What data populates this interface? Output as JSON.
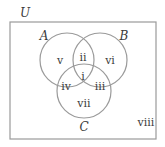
{
  "diagram": {
    "type": "venn",
    "universe": {
      "label": "U",
      "x": 20,
      "y": 17,
      "rect": {
        "x": 10,
        "y": 22,
        "w": 146,
        "h": 117
      }
    },
    "colors": {
      "stroke": "#9a9a9a",
      "text": "#3a3a3a",
      "background": "#ffffff"
    },
    "sets": [
      {
        "label": "A",
        "cx": 67,
        "cy": 60,
        "r": 27,
        "lx": 44,
        "ly": 40
      },
      {
        "label": "B",
        "cx": 100,
        "cy": 60,
        "r": 27,
        "lx": 124,
        "ly": 40
      },
      {
        "label": "C",
        "cx": 84,
        "cy": 91,
        "r": 27,
        "lx": 84,
        "ly": 131
      }
    ],
    "regions": [
      {
        "label": "i",
        "x": 83,
        "y": 76
      },
      {
        "label": "ii",
        "x": 83,
        "y": 57
      },
      {
        "label": "iii",
        "x": 100,
        "y": 86
      },
      {
        "label": "iv",
        "x": 66,
        "y": 86
      },
      {
        "label": "v",
        "x": 60,
        "y": 60
      },
      {
        "label": "vi",
        "x": 110,
        "y": 60
      },
      {
        "label": "vii",
        "x": 84,
        "y": 103
      },
      {
        "label": "viii",
        "x": 146,
        "y": 122
      }
    ]
  }
}
